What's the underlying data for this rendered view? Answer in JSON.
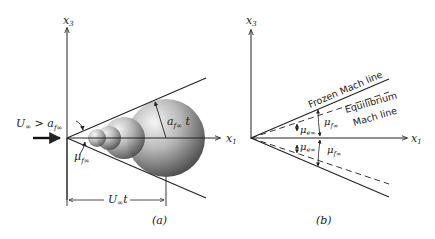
{
  "panel_a": {
    "caption": "(a)",
    "axis_x3": "x",
    "axis_x3_sub": "3",
    "axis_x1": "x",
    "axis_x1_sub": "1",
    "freestream_lhs": "U",
    "freestream_lhs_sub": "∞",
    "freestream_op": " > a",
    "freestream_rhs_sub": "f∞",
    "angle_label": "μ",
    "angle_label_sub": "f∞",
    "radius_label": "a",
    "radius_label_sub": "f∞",
    "radius_label_suffix": " t",
    "distance_label": "U",
    "distance_label_sub": "∞",
    "distance_label_suffix": "t"
  },
  "panel_b": {
    "caption": "(b)",
    "axis_x3": "x",
    "axis_x3_sub": "3",
    "axis_x1": "x",
    "axis_x1_sub": "1",
    "frozen_line_label": "Frozen Mach line",
    "equilibrium_line_label_1": "Equilibrium",
    "equilibrium_line_label_2": "Mach line",
    "mu_e_upper": "μ",
    "mu_e_upper_sub": "e∞",
    "mu_f_upper": "μ",
    "mu_f_upper_sub": "f∞",
    "mu_e_lower": "μ",
    "mu_e_lower_sub": "e∞",
    "mu_f_lower": "μ",
    "mu_f_lower_sub": "f∞"
  }
}
